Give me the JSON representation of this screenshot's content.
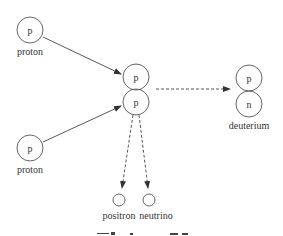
{
  "diagram": {
    "type": "nuclear-fusion-step",
    "nodes": {
      "proton_top": {
        "symbol": "p",
        "label": "proton"
      },
      "proton_bottom": {
        "symbol": "p",
        "label": "proton"
      },
      "intermediate_top": {
        "symbol": "p"
      },
      "intermediate_bottom": {
        "symbol": "p"
      },
      "deuterium_top": {
        "symbol": "p"
      },
      "deuterium_bottom": {
        "symbol": "n"
      },
      "deuterium_label": "deuterium",
      "positron_label": "positron",
      "neutrino_label": "neutrino"
    },
    "edges": [
      {
        "from": "proton_top",
        "to": "intermediate",
        "style": "solid"
      },
      {
        "from": "proton_bottom",
        "to": "intermediate",
        "style": "solid"
      },
      {
        "from": "intermediate",
        "to": "deuterium",
        "style": "dashed"
      },
      {
        "from": "intermediate",
        "to": "positron",
        "style": "dashed"
      },
      {
        "from": "intermediate",
        "to": "neutrino",
        "style": "dashed"
      }
    ],
    "colors": {
      "stroke": "#555555",
      "text": "#333333"
    }
  }
}
